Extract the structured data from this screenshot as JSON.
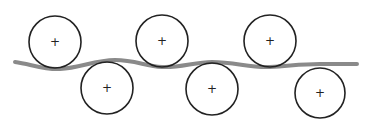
{
  "diagram": {
    "web_color": "#8a8a8a",
    "roller_color": "#222222",
    "rollers": [
      {
        "id": "top-1",
        "row": "top"
      },
      {
        "id": "bottom-1",
        "row": "bottom"
      },
      {
        "id": "top-2",
        "row": "top"
      },
      {
        "id": "bottom-2",
        "row": "bottom"
      },
      {
        "id": "top-3",
        "row": "top"
      },
      {
        "id": "bottom-3",
        "row": "bottom"
      }
    ],
    "center_mark": "+"
  }
}
